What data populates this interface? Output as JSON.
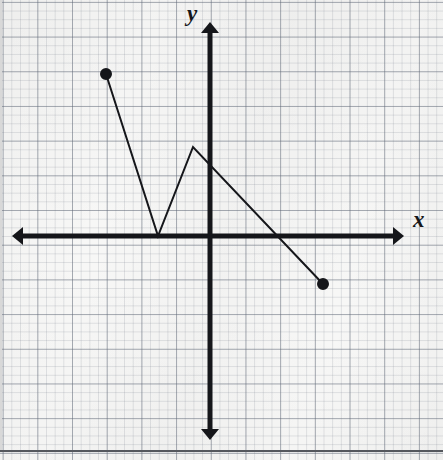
{
  "figure": {
    "kind": "cartesian-coordinate-plane",
    "width": 443,
    "height": 460,
    "background_color": "#f7f7f6",
    "ink_color": "#15161a",
    "grid_minor_color": "#788089",
    "grid_major_color": "#5f6876",
    "frame_color": "#55585e"
  },
  "axes": {
    "x_label": "x",
    "y_label": "y",
    "origin_px": {
      "x": 210,
      "y": 236
    },
    "unit_px": 34.7,
    "x_axis_y_px": 236,
    "y_axis_x_px": 210,
    "x_axis_start_px": 12,
    "x_axis_end_px": 404,
    "y_axis_start_px": 22,
    "y_axis_end_px": 440,
    "arrowheads": [
      "left",
      "right",
      "up",
      "down"
    ],
    "stroke_width": 5,
    "minor_grid_px": 8.675,
    "major_grid_px": 34.7,
    "ticks_shown": false,
    "tick_labels_shown": false
  },
  "chart_data": {
    "type": "line",
    "title": "",
    "xlabel": "x",
    "ylabel": "y",
    "grid": true,
    "legend": false,
    "xlim": [
      -6,
      6.7
    ],
    "ylim": [
      -6.2,
      6.2
    ],
    "series": [
      {
        "name": "piecewise-path",
        "style": "solid",
        "stroke_width": 2,
        "x": [
          -3,
          -1.5,
          -0.5,
          3.25
        ],
        "y": [
          4.7,
          0,
          2.6,
          -1.4
        ],
        "points_px": [
          {
            "x": 106,
            "y": 74
          },
          {
            "x": 158,
            "y": 236
          },
          {
            "x": 193,
            "y": 147
          },
          {
            "x": 323,
            "y": 284
          }
        ],
        "segments": [
          {
            "from": [
              -3,
              4.7
            ],
            "to": [
              -1.5,
              0
            ],
            "slope": -3.13,
            "direction": "decreasing"
          },
          {
            "from": [
              -1.5,
              0
            ],
            "to": [
              -0.5,
              2.6
            ],
            "slope": 2.6,
            "direction": "increasing"
          },
          {
            "from": [
              -0.5,
              2.6
            ],
            "to": [
              3.25,
              -1.4
            ],
            "slope": -1.07,
            "direction": "decreasing"
          }
        ]
      }
    ],
    "endpoints": [
      {
        "kind": "closed",
        "label": "left-endpoint",
        "x": -3,
        "y": 4.7,
        "px": {
          "x": 106,
          "y": 74
        },
        "radius_px": 5
      },
      {
        "kind": "closed",
        "label": "right-endpoint",
        "x": 3.25,
        "y": -1.4,
        "px": {
          "x": 323,
          "y": 284
        },
        "radius_px": 5
      }
    ],
    "vertices": [
      {
        "label": "minimum-vertex",
        "x": -1.5,
        "y": 0,
        "px": {
          "x": 158,
          "y": 236
        },
        "on_axis": "x-axis"
      },
      {
        "label": "maximum-vertex",
        "x": -0.5,
        "y": 2.6,
        "px": {
          "x": 193,
          "y": 147
        }
      }
    ],
    "x_intercepts": [
      -1.5,
      1.94
    ],
    "y_intercept": 2.07
  }
}
